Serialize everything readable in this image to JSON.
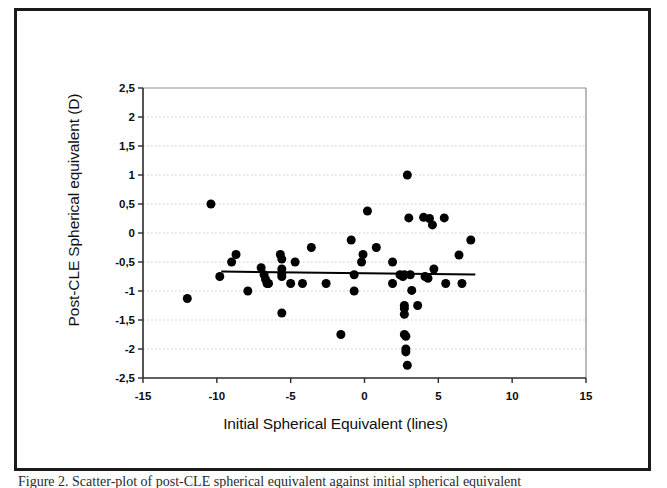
{
  "figure": {
    "caption": "Figure 2. Scatter-plot of post-CLE spherical equivalent against initial spherical equivalent"
  },
  "chart_data": {
    "type": "scatter",
    "title": "",
    "xlabel": "Initial Spherical Equivalent (lines)",
    "ylabel": "Post-CLE Spherical equivalent (D)",
    "xlim": [
      -15,
      15
    ],
    "ylim": [
      -2.5,
      2.5
    ],
    "xticks": [
      -15,
      -10,
      -5,
      0,
      5,
      10,
      15
    ],
    "xtick_labels": [
      "-15",
      "-10",
      "-5",
      "0",
      "5",
      "10",
      "15"
    ],
    "yticks": [
      -2.5,
      -2,
      -1.5,
      -1,
      -0.5,
      0,
      0.5,
      1,
      1.5,
      2,
      2.5
    ],
    "ytick_labels": [
      "-2,5",
      "-2",
      "-1,5",
      "-1",
      "-0,5",
      "0",
      "0,5",
      "1",
      "1,5",
      "2",
      "2,5"
    ],
    "grid": true,
    "grid_style": "dotted-horizontal",
    "legend": null,
    "marker": {
      "shape": "circle",
      "color": "#000000",
      "size_px": 9
    },
    "points": [
      [
        -12.0,
        -1.13
      ],
      [
        -10.4,
        0.5
      ],
      [
        -9.8,
        -0.75
      ],
      [
        -9.0,
        -0.5
      ],
      [
        -8.7,
        -0.37
      ],
      [
        -7.9,
        -1.0
      ],
      [
        -7.0,
        -0.6
      ],
      [
        -6.8,
        -0.72
      ],
      [
        -6.7,
        -0.8
      ],
      [
        -6.6,
        -0.87
      ],
      [
        -6.5,
        -0.87
      ],
      [
        -5.7,
        -0.37
      ],
      [
        -5.6,
        -0.45
      ],
      [
        -5.6,
        -0.62
      ],
      [
        -5.6,
        -0.7
      ],
      [
        -5.6,
        -0.75
      ],
      [
        -5.6,
        -1.38
      ],
      [
        -5.0,
        -0.87
      ],
      [
        -4.7,
        -0.5
      ],
      [
        -4.2,
        -0.87
      ],
      [
        -3.6,
        -0.25
      ],
      [
        -2.6,
        -0.87
      ],
      [
        -1.6,
        -1.75
      ],
      [
        -0.9,
        -0.12
      ],
      [
        -0.7,
        -0.72
      ],
      [
        -0.7,
        -1.0
      ],
      [
        -0.2,
        -0.5
      ],
      [
        -0.1,
        -0.37
      ],
      [
        0.2,
        0.38
      ],
      [
        0.8,
        -0.25
      ],
      [
        1.9,
        -0.5
      ],
      [
        1.9,
        -0.87
      ],
      [
        2.4,
        -0.72
      ],
      [
        2.6,
        -0.75
      ],
      [
        2.7,
        -0.72
      ],
      [
        2.7,
        -1.25
      ],
      [
        2.7,
        -1.3
      ],
      [
        2.7,
        -1.4
      ],
      [
        2.7,
        -1.75
      ],
      [
        2.8,
        -1.78
      ],
      [
        2.8,
        -2.0
      ],
      [
        2.8,
        -2.05
      ],
      [
        2.9,
        -2.28
      ],
      [
        2.9,
        1.0
      ],
      [
        3.0,
        0.26
      ],
      [
        3.1,
        -0.72
      ],
      [
        3.2,
        -0.99
      ],
      [
        3.6,
        -1.25
      ],
      [
        4.0,
        0.27
      ],
      [
        4.1,
        -0.75
      ],
      [
        4.3,
        -0.78
      ],
      [
        4.4,
        0.25
      ],
      [
        4.6,
        0.14
      ],
      [
        4.7,
        -0.62
      ],
      [
        5.4,
        0.26
      ],
      [
        5.5,
        -0.87
      ],
      [
        6.4,
        -0.38
      ],
      [
        6.6,
        -0.87
      ],
      [
        7.2,
        -0.12
      ]
    ],
    "trendline": {
      "x_start": -9.7,
      "y_start": -0.665,
      "x_end": 7.5,
      "y_end": -0.715,
      "color": "#000000",
      "width_px": 2
    }
  }
}
